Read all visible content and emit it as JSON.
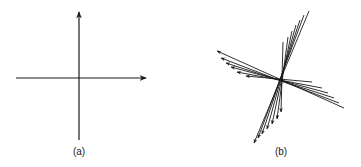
{
  "panels": [
    {
      "id": "a",
      "label": "(a)",
      "description": "Cartesian coordinate axes",
      "axes": {
        "horizontal": {
          "x1": 16,
          "y1": 78,
          "x2": 146,
          "y2": 78,
          "arrow": "right"
        },
        "vertical": {
          "x1": 79,
          "y1": 140,
          "x2": 79,
          "y2": 12,
          "arrow": "up"
        }
      },
      "label_pos": {
        "x": 79,
        "y": 155
      }
    },
    {
      "id": "b",
      "label": "(b)",
      "description": "Family of skewed axes rotating about a common origin",
      "center": {
        "x": 281,
        "y": 78
      },
      "group_left": [
        {
          "tail": [
            344,
            108
          ],
          "head": [
            217,
            51
          ]
        },
        {
          "tail": [
            339,
            103
          ],
          "head": [
            221,
            58
          ]
        },
        {
          "tail": [
            334,
            98
          ],
          "head": [
            226,
            63
          ]
        },
        {
          "tail": [
            328,
            93
          ],
          "head": [
            231,
            67
          ]
        },
        {
          "tail": [
            322,
            88
          ],
          "head": [
            237,
            72
          ]
        },
        {
          "tail": [
            312,
            82
          ],
          "head": [
            246,
            76
          ]
        }
      ],
      "group_down": [
        {
          "tail": [
            309,
            11
          ],
          "head": [
            254,
            143
          ]
        },
        {
          "tail": [
            304,
            15
          ],
          "head": [
            258,
            138
          ]
        },
        {
          "tail": [
            300,
            20
          ],
          "head": [
            262,
            134
          ]
        },
        {
          "tail": [
            296,
            25
          ],
          "head": [
            267,
            129
          ]
        },
        {
          "tail": [
            292,
            31
          ],
          "head": [
            272,
            124
          ]
        },
        {
          "tail": [
            288,
            37
          ],
          "head": [
            277,
            119
          ]
        },
        {
          "tail": [
            283,
            42
          ],
          "head": [
            281,
            112
          ]
        }
      ],
      "label_pos": {
        "x": 281,
        "y": 155
      }
    }
  ],
  "colors": {
    "stroke": "#1a1a1a",
    "background": "#ffffff"
  }
}
